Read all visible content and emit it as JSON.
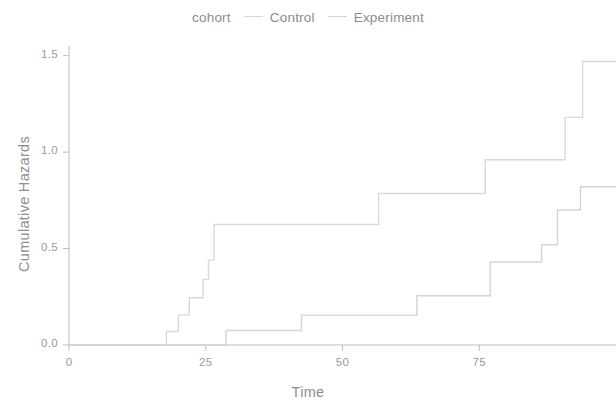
{
  "legend": {
    "title": "cohort",
    "entries": [
      {
        "label": "Control",
        "color": "#d9d9d9",
        "key_icon": "line-dash-icon"
      },
      {
        "label": "Experiment",
        "color": "#d4d4d4",
        "key_icon": "line-dash-icon"
      }
    ]
  },
  "axes": {
    "x_title": "Time",
    "y_title": "Cumulative Hazards",
    "x_ticks": [
      "0",
      "25",
      "50",
      "75"
    ],
    "y_ticks": [
      "0.0",
      "0.5",
      "1.0",
      "1.5"
    ]
  },
  "chart_data": {
    "type": "line",
    "title": "",
    "subtitle": "",
    "xlabel": "Time",
    "ylabel": "Cumulative Hazards",
    "xlim": [
      0,
      100
    ],
    "ylim": [
      0.0,
      1.55
    ],
    "x_ticks": [
      0,
      25,
      50,
      75
    ],
    "y_ticks": [
      0.0,
      0.5,
      1.0,
      1.5
    ],
    "grid": false,
    "legend_position": "top-center",
    "legend_title": "cohort",
    "step_style": "post",
    "series": [
      {
        "name": "Control",
        "color": "#d9d9d9",
        "points": [
          [
            0,
            0.0
          ],
          [
            17.8,
            0.0
          ],
          [
            17.8,
            0.07
          ],
          [
            20.0,
            0.07
          ],
          [
            20.0,
            0.155
          ],
          [
            22.0,
            0.155
          ],
          [
            22.0,
            0.245
          ],
          [
            24.5,
            0.245
          ],
          [
            24.5,
            0.34
          ],
          [
            25.5,
            0.34
          ],
          [
            25.5,
            0.44
          ],
          [
            26.5,
            0.44
          ],
          [
            26.5,
            0.625
          ],
          [
            56.6,
            0.625
          ],
          [
            56.6,
            0.785
          ],
          [
            76.1,
            0.785
          ],
          [
            76.1,
            0.96
          ],
          [
            90.7,
            0.96
          ],
          [
            90.7,
            1.18
          ],
          [
            93.9,
            1.18
          ],
          [
            93.9,
            1.47
          ],
          [
            100,
            1.47
          ]
        ]
      },
      {
        "name": "Experiment",
        "color": "#d4d4d4",
        "points": [
          [
            0,
            0.0
          ],
          [
            28.7,
            0.0
          ],
          [
            28.7,
            0.075
          ],
          [
            42.5,
            0.075
          ],
          [
            42.5,
            0.155
          ],
          [
            63.6,
            0.155
          ],
          [
            63.6,
            0.255
          ],
          [
            77.0,
            0.255
          ],
          [
            77.0,
            0.43
          ],
          [
            86.4,
            0.43
          ],
          [
            86.4,
            0.52
          ],
          [
            89.3,
            0.52
          ],
          [
            89.3,
            0.7
          ],
          [
            93.5,
            0.7
          ],
          [
            93.5,
            0.82
          ],
          [
            100,
            0.82
          ]
        ]
      }
    ]
  }
}
